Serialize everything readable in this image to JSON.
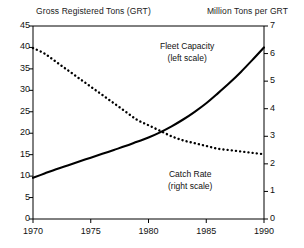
{
  "chart": {
    "left_axis_title": "Gross Registered Tons (GRT)",
    "right_axis_title": "Million Tons per GRT",
    "annotations": {
      "fleet": {
        "line1": "Fleet Capacity",
        "line2": "(left scale)"
      },
      "catch": {
        "line1": "Catch Rate",
        "line2": "(right scale)"
      }
    },
    "left_ticks": [
      "0",
      "5",
      "10",
      "15",
      "20",
      "25",
      "30",
      "35",
      "40",
      "45"
    ],
    "right_ticks": [
      "0",
      "1",
      "2",
      "3",
      "4",
      "5",
      "6",
      "7"
    ],
    "x_ticks": [
      "1970",
      "1975",
      "1980",
      "1985",
      "1990"
    ]
  },
  "chart_data": {
    "type": "line",
    "title": "",
    "subtitle": "",
    "xlabel": "",
    "ylabel": "Gross Registered Tons (GRT)",
    "y2label": "Million Tons per GRT",
    "xlim": [
      1970,
      1990
    ],
    "ylim": [
      0,
      45
    ],
    "y2lim": [
      0,
      7
    ],
    "xticks": [
      1970,
      1975,
      1980,
      1985,
      1990
    ],
    "yticks": [
      0,
      5,
      10,
      15,
      20,
      25,
      30,
      35,
      40,
      45
    ],
    "y2ticks": [
      0,
      1,
      2,
      3,
      4,
      5,
      6,
      7
    ],
    "grid": false,
    "legend": "annotations-inline",
    "x": [
      1970,
      1971,
      1972,
      1973,
      1974,
      1975,
      1976,
      1977,
      1978,
      1979,
      1980,
      1981,
      1982,
      1983,
      1984,
      1985,
      1986,
      1987,
      1988,
      1989,
      1990
    ],
    "series": [
      {
        "name": "Fleet Capacity",
        "axis": "left",
        "style": "solid",
        "units": "Gross Registered Tons (GRT)",
        "values": [
          9.6,
          10.6,
          11.6,
          12.5,
          13.4,
          14.3,
          15.2,
          16.1,
          17.0,
          18.0,
          19.0,
          20.2,
          21.6,
          23.2,
          25.0,
          27.0,
          29.3,
          31.7,
          34.3,
          37.1,
          40.0
        ]
      },
      {
        "name": "Catch Rate",
        "axis": "right",
        "style": "dotted",
        "units": "Million Tons per GRT",
        "values": [
          6.2,
          6.0,
          5.7,
          5.4,
          5.1,
          4.8,
          4.5,
          4.2,
          3.9,
          3.6,
          3.4,
          3.2,
          3.0,
          2.85,
          2.75,
          2.65,
          2.55,
          2.5,
          2.45,
          2.4,
          2.35
        ]
      }
    ],
    "annotations": [
      {
        "text": "Fleet Capacity (left scale)",
        "x": 1983,
        "y": 36
      },
      {
        "text": "Catch Rate (right scale)",
        "x": 1984,
        "y": 11
      }
    ]
  }
}
